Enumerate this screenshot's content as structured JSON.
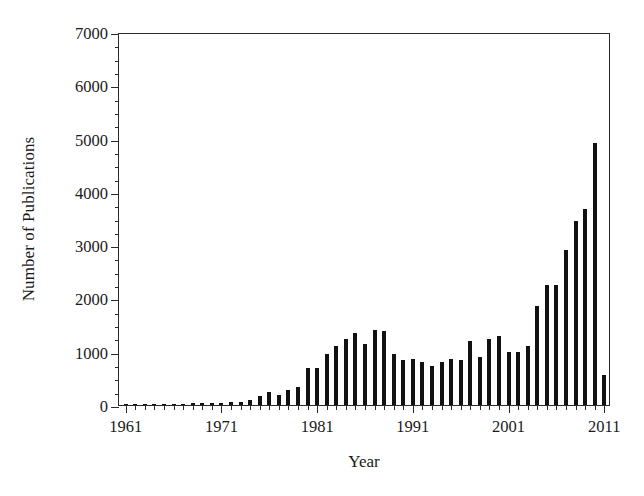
{
  "chart_data": {
    "type": "bar",
    "title": "",
    "xlabel": "Year",
    "ylabel": "Number of Publications",
    "xlim": [
      1960.3,
      2011.7
    ],
    "ylim": [
      0,
      7000
    ],
    "grid": false,
    "legend": null,
    "y_ticks_major": [
      0,
      1000,
      2000,
      3000,
      4000,
      5000,
      6000,
      7000
    ],
    "y_tick_labels": [
      "0",
      "1000",
      "2000",
      "3000",
      "4000",
      "5000",
      "6000",
      "7000"
    ],
    "y_minor_interval": 250,
    "x_ticks_labeled": [
      1961,
      1971,
      1981,
      1991,
      2001,
      2011
    ],
    "x_tick_labels": [
      "1961",
      "1971",
      "1981",
      "1991",
      "2001",
      "2011"
    ],
    "x_minor_interval": 1,
    "bar_color": "#111111",
    "axis_color": "#2b2b2b",
    "categories": [
      1961,
      1962,
      1963,
      1964,
      1965,
      1966,
      1967,
      1968,
      1969,
      1970,
      1971,
      1972,
      1973,
      1974,
      1975,
      1976,
      1977,
      1978,
      1979,
      1980,
      1981,
      1982,
      1983,
      1984,
      1985,
      1986,
      1987,
      1988,
      1989,
      1990,
      1991,
      1992,
      1993,
      1994,
      1995,
      1996,
      1997,
      1998,
      1999,
      2000,
      2001,
      2002,
      2003,
      2004,
      2005,
      2006,
      2007,
      2008,
      2009,
      2010,
      2011
    ],
    "values": [
      3,
      4,
      5,
      6,
      8,
      10,
      12,
      35,
      30,
      38,
      45,
      55,
      62,
      95,
      170,
      250,
      190,
      290,
      340,
      700,
      700,
      950,
      1100,
      1230,
      1350,
      1150,
      1400,
      1380,
      950,
      840,
      870,
      810,
      740,
      800,
      860,
      840,
      1200,
      900,
      1240,
      1300,
      990,
      1000,
      1100,
      1850,
      2250,
      2250,
      2900,
      3450,
      3680,
      4920,
      6150
    ],
    "peak": {
      "year": 2010,
      "value": 6150
    },
    "last_partial_year": {
      "year": 2011,
      "value": 560
    }
  }
}
